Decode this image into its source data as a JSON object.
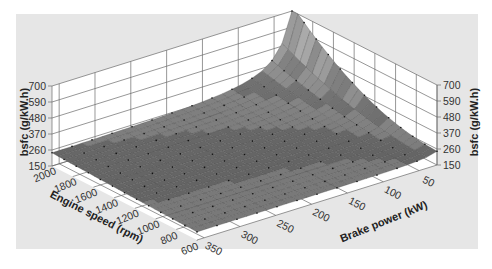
{
  "chart_data": {
    "type": "surface3d",
    "title": "",
    "zlabel": "bsfc (g/kW.h)",
    "xlabel": "Engine speed (rpm)",
    "ylabel": "Brake power (kW)",
    "x_ticks": [
      600,
      800,
      1000,
      1200,
      1400,
      1600,
      1800,
      2000
    ],
    "y_ticks": [
      50,
      100,
      150,
      200,
      250,
      300,
      350
    ],
    "z_ticks": [
      150,
      260,
      370,
      480,
      590,
      700
    ],
    "xlim": [
      600,
      2000
    ],
    "ylim": [
      25,
      360
    ],
    "zlim": [
      150,
      700
    ],
    "grid": true,
    "colormap": "grayscale",
    "surface_samples": [
      {
        "engine_speed": 2000,
        "brake_power": 25,
        "bsfc": 700
      },
      {
        "engine_speed": 2000,
        "brake_power": 50,
        "bsfc": 520
      },
      {
        "engine_speed": 2000,
        "brake_power": 100,
        "bsfc": 330
      },
      {
        "engine_speed": 2000,
        "brake_power": 200,
        "bsfc": 240
      },
      {
        "engine_speed": 2000,
        "brake_power": 350,
        "bsfc": 230
      },
      {
        "engine_speed": 1400,
        "brake_power": 25,
        "bsfc": 420
      },
      {
        "engine_speed": 1400,
        "brake_power": 100,
        "bsfc": 250
      },
      {
        "engine_speed": 1400,
        "brake_power": 350,
        "bsfc": 215
      },
      {
        "engine_speed": 600,
        "brake_power": 25,
        "bsfc": 250
      },
      {
        "engine_speed": 600,
        "brake_power": 200,
        "bsfc": 210
      },
      {
        "engine_speed": 600,
        "brake_power": 350,
        "bsfc": 205
      }
    ]
  },
  "labels": {
    "z_left": "bsfc (g/kW.h)",
    "z_right": "bsfc (g/kW.h)",
    "x_axis": "Engine speed (rpm)",
    "y_axis": "Brake power (kW)"
  },
  "colors": {
    "background": "#e6e6e6",
    "pane": "#ffffff",
    "grid": "#6a6a6a",
    "surface_low": "#6f6f6f",
    "surface_high": "#b0b0b0"
  }
}
